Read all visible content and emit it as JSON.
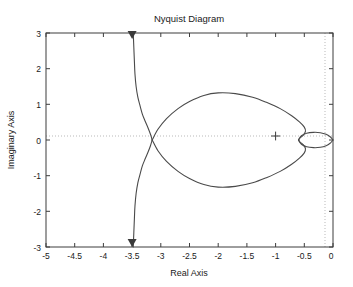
{
  "figure": {
    "title": "Nyquist Diagram",
    "background_color": "#ffffff",
    "axes_color": "#3d3d3d",
    "curve_color": "#4a4a4a",
    "grid_color": "#b9b9b9"
  },
  "axis": {
    "x_label": "Real Axis",
    "y_label": "Imaginary Axis",
    "x_ticks": [
      "-5",
      "-4.5",
      "-4",
      "-3.5",
      "-3",
      "-2.5",
      "-2",
      "-1.5",
      "-1",
      "-0.5",
      "0"
    ],
    "y_ticks": [
      "3",
      "2",
      "1",
      "0",
      "-1",
      "-2",
      "-3"
    ]
  },
  "chart_data": {
    "type": "line",
    "title": "Nyquist Diagram",
    "xlabel": "Real Axis",
    "ylabel": "Imaginary Axis",
    "xlim": [
      -5,
      0
    ],
    "ylim": [
      -3,
      3
    ],
    "xticks": [
      -5,
      -4.5,
      -4,
      -3.5,
      -3,
      -2.5,
      -2,
      -1.5,
      -1,
      -0.5,
      0
    ],
    "yticks": [
      -3,
      -2,
      -1,
      0,
      1,
      2,
      3
    ],
    "grid": false,
    "zero_lines": {
      "x": 0,
      "y": 0,
      "style": "dotted"
    },
    "legend": "none",
    "annotations": [
      {
        "name": "critical-point",
        "marker": "+",
        "x": -1,
        "y": 0
      },
      {
        "name": "direction-arrow-top",
        "marker": "triangle-down",
        "x": -3.5,
        "y": 3
      },
      {
        "name": "direction-arrow-bottom",
        "marker": "triangle-down",
        "x": -3.5,
        "y": -3
      }
    ],
    "series": [
      {
        "name": "nyquist-branch-upper",
        "comment": "Outer vertical asymptote branch descending from +3 down through real-axis crossing near -3.15",
        "points": [
          [
            -3.48,
            3.0
          ],
          [
            -3.47,
            2.6
          ],
          [
            -3.46,
            2.2
          ],
          [
            -3.45,
            1.85
          ],
          [
            -3.43,
            1.5
          ],
          [
            -3.4,
            1.2
          ],
          [
            -3.36,
            0.95
          ],
          [
            -3.32,
            0.72
          ],
          [
            -3.27,
            0.52
          ],
          [
            -3.22,
            0.33
          ],
          [
            -3.18,
            0.16
          ],
          [
            -3.15,
            0.0
          ]
        ]
      },
      {
        "name": "nyquist-branch-lower",
        "comment": "Mirror of upper branch, from real-axis crossing down to -3",
        "points": [
          [
            -3.15,
            0.0
          ],
          [
            -3.18,
            -0.16
          ],
          [
            -3.22,
            -0.33
          ],
          [
            -3.27,
            -0.52
          ],
          [
            -3.32,
            -0.72
          ],
          [
            -3.36,
            -0.95
          ],
          [
            -3.4,
            -1.2
          ],
          [
            -3.43,
            -1.5
          ],
          [
            -3.45,
            -1.85
          ],
          [
            -3.46,
            -2.2
          ],
          [
            -3.47,
            -2.6
          ],
          [
            -3.48,
            -3.0
          ]
        ]
      },
      {
        "name": "nyquist-main-lobe-upper",
        "comment": "Large cardioid lobe sweeping right from the crossing, peak imag about 1.32 near real -2.2",
        "points": [
          [
            -3.15,
            0.0
          ],
          [
            -3.05,
            0.3
          ],
          [
            -2.9,
            0.6
          ],
          [
            -2.7,
            0.88
          ],
          [
            -2.5,
            1.08
          ],
          [
            -2.25,
            1.25
          ],
          [
            -2.0,
            1.32
          ],
          [
            -1.7,
            1.3
          ],
          [
            -1.4,
            1.2
          ],
          [
            -1.15,
            1.05
          ],
          [
            -0.92,
            0.88
          ],
          [
            -0.72,
            0.68
          ],
          [
            -0.58,
            0.5
          ],
          [
            -0.5,
            0.36
          ],
          [
            -0.48,
            0.24
          ],
          [
            -0.52,
            0.13
          ],
          [
            -0.58,
            0.05
          ],
          [
            -0.6,
            0.0
          ]
        ]
      },
      {
        "name": "nyquist-main-lobe-lower",
        "comment": "Mirror image of the main lobe below the real axis",
        "points": [
          [
            -3.15,
            0.0
          ],
          [
            -3.05,
            -0.3
          ],
          [
            -2.9,
            -0.6
          ],
          [
            -2.7,
            -0.88
          ],
          [
            -2.5,
            -1.08
          ],
          [
            -2.25,
            -1.25
          ],
          [
            -2.0,
            -1.32
          ],
          [
            -1.7,
            -1.3
          ],
          [
            -1.4,
            -1.2
          ],
          [
            -1.15,
            -1.05
          ],
          [
            -0.92,
            -0.88
          ],
          [
            -0.72,
            -0.68
          ],
          [
            -0.58,
            -0.5
          ],
          [
            -0.5,
            -0.36
          ],
          [
            -0.48,
            -0.24
          ],
          [
            -0.52,
            -0.13
          ],
          [
            -0.58,
            -0.05
          ],
          [
            -0.6,
            0.0
          ]
        ]
      },
      {
        "name": "nyquist-inner-lens-upper",
        "comment": "Small lens-shaped loop between real -0.6 and 0, half-height about 0.21",
        "points": [
          [
            -0.6,
            0.0
          ],
          [
            -0.55,
            0.12
          ],
          [
            -0.46,
            0.19
          ],
          [
            -0.34,
            0.215
          ],
          [
            -0.22,
            0.205
          ],
          [
            -0.12,
            0.16
          ],
          [
            -0.05,
            0.09
          ],
          [
            -0.01,
            0.02
          ],
          [
            0.0,
            0.0
          ]
        ]
      },
      {
        "name": "nyquist-inner-lens-lower",
        "comment": "Lower half of the small lens loop",
        "points": [
          [
            0.0,
            0.0
          ],
          [
            -0.01,
            -0.02
          ],
          [
            -0.05,
            -0.09
          ],
          [
            -0.12,
            -0.16
          ],
          [
            -0.22,
            -0.205
          ],
          [
            -0.34,
            -0.215
          ],
          [
            -0.46,
            -0.19
          ],
          [
            -0.55,
            -0.12
          ],
          [
            -0.6,
            0.0
          ]
        ]
      }
    ]
  }
}
